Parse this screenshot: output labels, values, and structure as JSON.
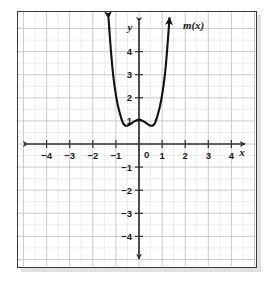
{
  "figure": {
    "kind": "coordinate-grid-graph",
    "frame_color": "#3a3a3a",
    "background_color": "#ffffff"
  },
  "chart_data": {
    "type": "line",
    "title": "",
    "subtitle": "",
    "xlabel": "x",
    "ylabel": "y",
    "xlim": [
      -5,
      5
    ],
    "ylim": [
      -5,
      5
    ],
    "grid": true,
    "minor_grid": true,
    "minor_grid_step": 0.5,
    "major_grid_step": 1,
    "legend_position": "none",
    "annotations": [
      {
        "text": "m(x)",
        "x": 1.9,
        "y": 5.0
      }
    ],
    "xticks": [
      -4,
      -3,
      -2,
      -1,
      0,
      1,
      2,
      3,
      4
    ],
    "xtick_labels": [
      "−4",
      "−3",
      "−2",
      "−1",
      "0",
      "1",
      "2",
      "3",
      "4"
    ],
    "yticks": [
      4,
      3,
      2,
      1,
      -1,
      -2,
      -3,
      -4
    ],
    "ytick_labels": [
      "4",
      "3",
      "2",
      "1",
      "−1",
      "−2",
      "−3",
      "−4"
    ],
    "origin_label": "0",
    "axis_arrows": [
      "left",
      "right",
      "up",
      "down"
    ],
    "series": [
      {
        "name": "m(x)",
        "color": "#111111",
        "width": 2.1,
        "arrow_start": true,
        "arrow_end": true,
        "key_points": {
          "local_maximum": {
            "x": 0,
            "y": 1.05
          },
          "local_minima": [
            {
              "x": -0.65,
              "y": 0.8
            },
            {
              "x": 0.65,
              "y": 0.8
            }
          ]
        },
        "points": [
          {
            "x": -1.32,
            "y": 5.45
          },
          {
            "x": -1.28,
            "y": 4.9
          },
          {
            "x": -1.24,
            "y": 4.35
          },
          {
            "x": -1.2,
            "y": 3.85
          },
          {
            "x": -1.16,
            "y": 3.4
          },
          {
            "x": -1.12,
            "y": 3.0
          },
          {
            "x": -1.07,
            "y": 2.6
          },
          {
            "x": -1.02,
            "y": 2.25
          },
          {
            "x": -0.97,
            "y": 1.95
          },
          {
            "x": -0.92,
            "y": 1.7
          },
          {
            "x": -0.87,
            "y": 1.48
          },
          {
            "x": -0.82,
            "y": 1.3
          },
          {
            "x": -0.77,
            "y": 1.12
          },
          {
            "x": -0.72,
            "y": 0.98
          },
          {
            "x": -0.67,
            "y": 0.87
          },
          {
            "x": -0.6,
            "y": 0.8
          },
          {
            "x": -0.52,
            "y": 0.79
          },
          {
            "x": -0.44,
            "y": 0.82
          },
          {
            "x": -0.36,
            "y": 0.87
          },
          {
            "x": -0.28,
            "y": 0.93
          },
          {
            "x": -0.2,
            "y": 0.98
          },
          {
            "x": -0.12,
            "y": 1.02
          },
          {
            "x": -0.05,
            "y": 1.05
          },
          {
            "x": 0,
            "y": 1.06
          },
          {
            "x": 0.05,
            "y": 1.05
          },
          {
            "x": 0.12,
            "y": 1.02
          },
          {
            "x": 0.2,
            "y": 0.98
          },
          {
            "x": 0.28,
            "y": 0.93
          },
          {
            "x": 0.36,
            "y": 0.87
          },
          {
            "x": 0.44,
            "y": 0.82
          },
          {
            "x": 0.52,
            "y": 0.79
          },
          {
            "x": 0.6,
            "y": 0.8
          },
          {
            "x": 0.67,
            "y": 0.87
          },
          {
            "x": 0.72,
            "y": 0.98
          },
          {
            "x": 0.77,
            "y": 1.12
          },
          {
            "x": 0.82,
            "y": 1.3
          },
          {
            "x": 0.87,
            "y": 1.48
          },
          {
            "x": 0.92,
            "y": 1.7
          },
          {
            "x": 0.97,
            "y": 1.95
          },
          {
            "x": 1.02,
            "y": 2.25
          },
          {
            "x": 1.07,
            "y": 2.6
          },
          {
            "x": 1.12,
            "y": 3.0
          },
          {
            "x": 1.16,
            "y": 3.4
          },
          {
            "x": 1.2,
            "y": 3.85
          },
          {
            "x": 1.24,
            "y": 4.35
          },
          {
            "x": 1.28,
            "y": 4.9
          },
          {
            "x": 1.32,
            "y": 5.45
          }
        ]
      }
    ]
  }
}
